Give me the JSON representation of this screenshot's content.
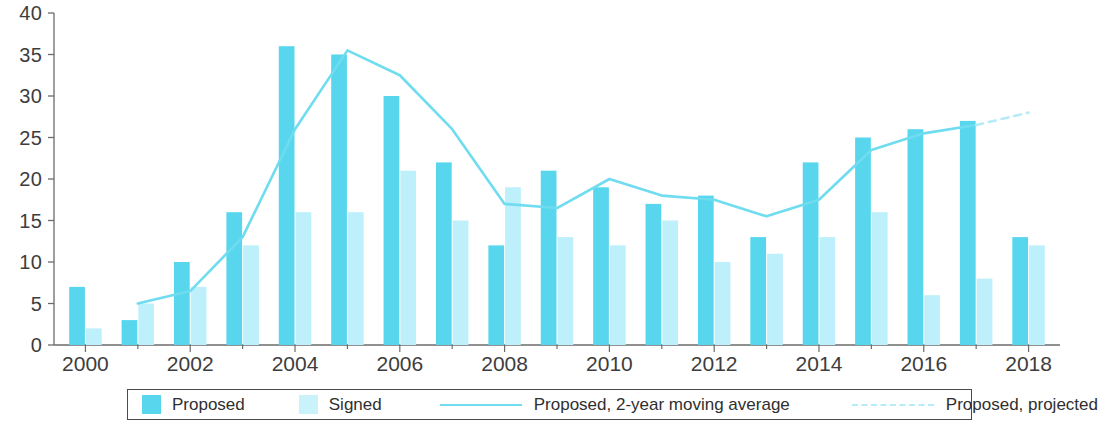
{
  "chart_data": {
    "type": "bar",
    "title": "",
    "subtitle": "",
    "xlabel": "",
    "ylabel": "",
    "ylim": [
      0,
      40
    ],
    "yticks": [
      0,
      5,
      10,
      15,
      20,
      25,
      30,
      35,
      40
    ],
    "xlim": [
      1999.4,
      2018.6
    ],
    "xticks": [
      2000,
      2002,
      2004,
      2006,
      2008,
      2010,
      2012,
      2014,
      2016,
      2018
    ],
    "xtick_labels": [
      "2000",
      "2002",
      "2004",
      "2006",
      "2008",
      "2010",
      "2012",
      "2014",
      "2016",
      "2018"
    ],
    "grid": false,
    "legend_position": "bottom",
    "categories": [
      2000,
      2001,
      2002,
      2003,
      2004,
      2005,
      2006,
      2007,
      2008,
      2009,
      2010,
      2011,
      2012,
      2013,
      2014,
      2015,
      2016,
      2017,
      2018
    ],
    "series": [
      {
        "name": "Proposed",
        "kind": "bar",
        "color": "#57d6ee",
        "values": [
          7,
          3,
          10,
          16,
          36,
          35,
          30,
          22,
          12,
          21,
          19,
          17,
          18,
          13,
          22,
          25,
          26,
          27,
          13
        ]
      },
      {
        "name": "Signed",
        "kind": "bar",
        "color": "#bdf0fa",
        "values": [
          2,
          5,
          7,
          12,
          16,
          16,
          21,
          15,
          19,
          13,
          12,
          15,
          10,
          11,
          13,
          16,
          6,
          8,
          12
        ]
      },
      {
        "name": "Proposed, 2-year moving average",
        "kind": "line",
        "color": "#6fdcef",
        "style": "solid",
        "x": [
          2001,
          2002,
          2003,
          2004,
          2005,
          2006,
          2007,
          2008,
          2009,
          2010,
          2011,
          2012,
          2013,
          2014,
          2015,
          2016,
          2017
        ],
        "values": [
          5,
          6.5,
          13,
          26,
          35.5,
          32.5,
          26,
          17,
          16.5,
          20,
          18,
          17.5,
          15.5,
          17.5,
          23.5,
          25.5,
          26.5
        ]
      },
      {
        "name": "Proposed, projected",
        "kind": "line",
        "color": "#b6ecf7",
        "style": "dashed",
        "x": [
          2017,
          2018
        ],
        "values": [
          26.5,
          28
        ]
      }
    ]
  },
  "legend": {
    "items": [
      {
        "label": "Proposed",
        "marker": "swatch-proposed"
      },
      {
        "label": "Signed",
        "marker": "swatch-signed"
      },
      {
        "label": "Proposed, 2-year moving average",
        "marker": "line-solid"
      },
      {
        "label": "Proposed, projected",
        "marker": "line-dashed"
      }
    ]
  },
  "colors": {
    "proposed": "#57d6ee",
    "signed": "#bdf0fa",
    "moving_average_line": "#6fdcef",
    "projected_line": "#b6ecf7",
    "axis": "#6b6b6b",
    "text": "#3d3d3d"
  }
}
